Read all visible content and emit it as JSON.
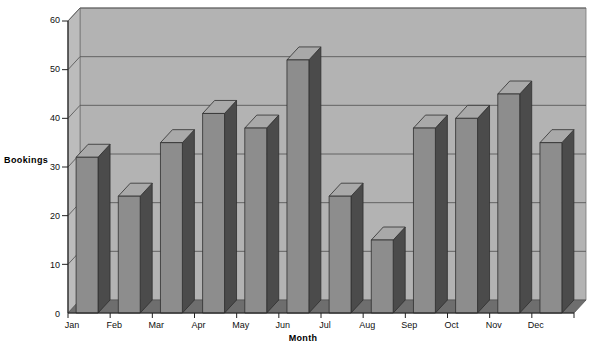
{
  "chart_data": {
    "type": "bar",
    "title": "",
    "xlabel": "Month",
    "ylabel": "Bookings",
    "categories": [
      "Jan",
      "Feb",
      "Mar",
      "Apr",
      "May",
      "Jun",
      "Jul",
      "Aug",
      "Sep",
      "Oct",
      "Nov",
      "Dec"
    ],
    "values": [
      32,
      24,
      35,
      41,
      38,
      52,
      24,
      15,
      38,
      40,
      45,
      35
    ],
    "yticks": [
      0,
      10,
      20,
      30,
      40,
      50,
      60
    ],
    "ylim": [
      0,
      60
    ],
    "grid": true,
    "legend": null,
    "style": "3d-bar",
    "colors": {
      "bar_front": "#8d8d8d",
      "bar_side": "#4b4b4b",
      "bar_top": "#a9a9a9",
      "wall_back": "#b3b3b3",
      "wall_left": "#bcbcbc",
      "floor": "#6e6e6e",
      "gridline": "#5a5a5a",
      "text": "#101010",
      "page_background": "#ffffff"
    }
  }
}
